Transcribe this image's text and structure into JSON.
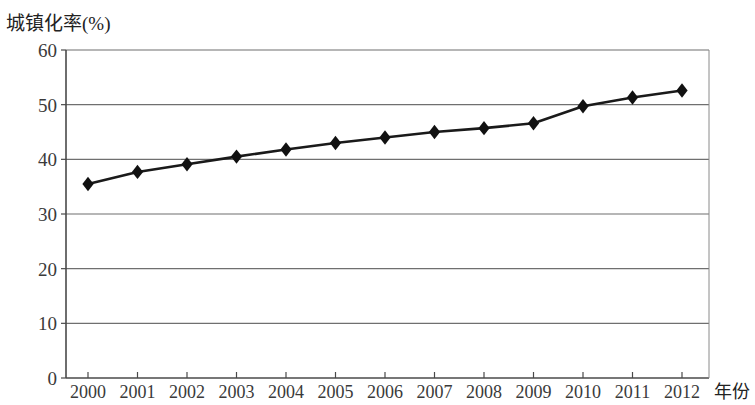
{
  "chart_data": {
    "type": "line",
    "title": "",
    "ylabel": "城镇化率(%)",
    "xlabel": "年份",
    "x": [
      2000,
      2001,
      2002,
      2003,
      2004,
      2005,
      2006,
      2007,
      2008,
      2009,
      2010,
      2011,
      2012
    ],
    "categories": [
      "2000",
      "2001",
      "2002",
      "2003",
      "2004",
      "2005",
      "2006",
      "2007",
      "2008",
      "2009",
      "2010",
      "2011",
      "2012"
    ],
    "values": [
      35.5,
      37.7,
      39.1,
      40.5,
      41.8,
      43.0,
      44.0,
      45.0,
      45.7,
      46.6,
      49.7,
      51.3,
      52.6
    ],
    "series": [
      {
        "name": "城镇化率",
        "values": [
          35.5,
          37.7,
          39.1,
          40.5,
          41.8,
          43.0,
          44.0,
          45.0,
          45.7,
          46.6,
          49.7,
          51.3,
          52.6
        ]
      }
    ],
    "ylim": [
      0,
      60
    ],
    "ytick_labels": [
      "0",
      "10",
      "20",
      "30",
      "40",
      "50",
      "60"
    ],
    "yticks": [
      0,
      10,
      20,
      30,
      40,
      50,
      60
    ],
    "xlim": [
      1999.5,
      2012.5
    ],
    "grid": "horizontal",
    "legend": "none",
    "marker": "diamond",
    "line_color": "#1a1a1a",
    "marker_color": "#111111",
    "grid_color": "#6f6f6f",
    "axis_color": "#4a4a4a",
    "background": "#ffffff"
  },
  "axes": {
    "y_title": "城镇化率(%)",
    "x_title": "年份"
  }
}
